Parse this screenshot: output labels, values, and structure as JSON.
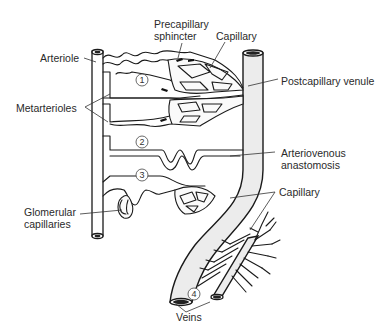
{
  "figure": {
    "labels": {
      "arteriole": "Arteriole",
      "precapillary_sphincter_line1": "Precapillary",
      "precapillary_sphincter_line2": "sphincter",
      "capillary_top": "Capillary",
      "postcapillary_venule": "Postcapillary venule",
      "metarterioles": "Metarterioles",
      "arteriovenous_line1": "Arteriovenous",
      "arteriovenous_line2": "anastomosis",
      "capillary_bottom": "Capillary",
      "glomerular_line1": "Glomerular",
      "glomerular_line2": "capillaries",
      "veins": "Veins"
    },
    "numbers": [
      "1",
      "2",
      "3",
      "4"
    ]
  }
}
